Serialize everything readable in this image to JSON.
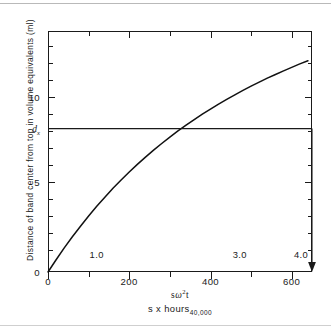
{
  "figure": {
    "ylabel": "Distance of band center from top in volume equivalents  (ml)",
    "xtitle_primary_prefix": "s",
    "xtitle_primary_omega": "ω",
    "xtitle_primary_exp": "2",
    "xtitle_primary_suffix": "t",
    "xtitle_secondary_main": "s x hours",
    "xtitle_secondary_sub": "40,000",
    "dx_label_main": "d",
    "dx_label_sub": "x",
    "curve_color": "#111111",
    "axis_color": "#1a1a1a",
    "background": "#ffffff"
  },
  "chart_data": {
    "type": "line",
    "title": "",
    "subtitle": "",
    "xlabel": "sω2t  /  s x hours 40,000",
    "ylabel": "Distance of band center from top in volume equivalents (ml)",
    "xlim": [
      0,
      650
    ],
    "ylim": [
      0,
      14.2
    ],
    "grid": false,
    "legend": null,
    "x_ticks_major": [
      0,
      200,
      400,
      600
    ],
    "x_tick_labels_major": [
      "0",
      "200",
      "400",
      "600"
    ],
    "x_ticks_minor": [
      100,
      300,
      500
    ],
    "x_secondary_ticks": [
      120,
      295,
      470,
      645
    ],
    "x_secondary_labels": [
      "1.0",
      "2.0",
      "3.0",
      "4.0"
    ],
    "x_secondary_hidden": [
      "2.0"
    ],
    "y_ticks_major": [
      5,
      10
    ],
    "y_tick_labels_major": [
      "5",
      "10"
    ],
    "y_ticks_minor": [
      1,
      2,
      3,
      4,
      6,
      7,
      8,
      9,
      11,
      12,
      13,
      14
    ],
    "y_origin_label": "0",
    "series": [
      {
        "name": "band center position",
        "x": [
          0,
          20,
          40,
          60,
          80,
          100,
          120,
          140,
          160,
          180,
          200,
          220,
          240,
          260,
          280,
          300,
          320,
          340,
          360,
          380,
          400,
          420,
          440,
          460,
          480,
          500,
          520,
          540,
          560,
          580,
          600,
          620,
          640
        ],
        "y": [
          0.0,
          0.72,
          1.42,
          2.08,
          2.7,
          3.3,
          3.87,
          4.41,
          4.93,
          5.42,
          5.89,
          6.34,
          6.77,
          7.18,
          7.57,
          7.95,
          8.31,
          8.65,
          8.98,
          9.3,
          9.6,
          9.89,
          10.17,
          10.44,
          10.7,
          10.95,
          11.19,
          11.42,
          11.64,
          11.85,
          12.06,
          12.26,
          12.45
        ]
      }
    ],
    "annotations": [
      {
        "name": "dx-horizontal-guide",
        "type": "hline",
        "label": "d_x",
        "y": 8.45,
        "x_from": 0,
        "x_to": 312
      },
      {
        "name": "dx-vertical-arrow",
        "type": "vline-arrow",
        "x": 312,
        "y_from": 8.45,
        "y_to": 0,
        "arrow": "down"
      }
    ]
  }
}
